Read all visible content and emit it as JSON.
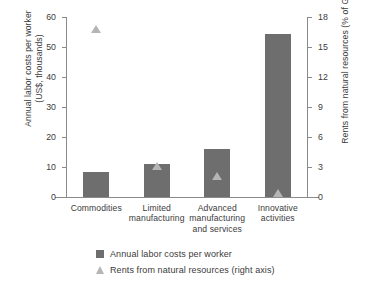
{
  "chart_data": {
    "type": "bar",
    "title": "",
    "categories": [
      "Commodities",
      "Limited\nmanufacturing",
      "Advanced\nmanufacturing\nand services",
      "Innovative\nactivities"
    ],
    "series": [
      {
        "name": "Annual labor costs per worker",
        "type": "bar",
        "axis": "left",
        "color": "#6e6e6e",
        "values": [
          8.4,
          11.1,
          16.0,
          54.3
        ]
      },
      {
        "name": "Rents from natural resources (right axis)",
        "type": "scatter",
        "axis": "right",
        "color": "#b5b5b5",
        "values": [
          16.8,
          3.1,
          2.1,
          0.4
        ]
      }
    ],
    "xlabel": "",
    "ylabel": "Annual labor costs per worker\n(US$, thousands)",
    "ylabel_right": "Rents from natural resources (% of GDP)",
    "ylim": [
      0,
      60
    ],
    "ylim_right": [
      0,
      18
    ],
    "yticks": [
      0,
      10,
      20,
      30,
      40,
      50,
      60
    ],
    "yticks_right": [
      0,
      3,
      6,
      9,
      12,
      15,
      18
    ],
    "grid": false,
    "legend_position": "bottom"
  },
  "axes": {
    "left_title": "Annual labor costs per worker\n(US$, thousands)",
    "right_title": "Rents from natural resources (% of GDP)",
    "left_ticks": [
      "60",
      "50",
      "40",
      "30",
      "20",
      "10",
      "0"
    ],
    "right_ticks": [
      "18",
      "15",
      "12",
      "9",
      "6",
      "3",
      "0"
    ]
  },
  "categories": [
    {
      "label": "Commodities"
    },
    {
      "label": "Limited\nmanufacturing"
    },
    {
      "label": "Advanced\nmanufacturing\nand services"
    },
    {
      "label": "Innovative\nactivities"
    }
  ],
  "legend": {
    "items": [
      {
        "label": "Annual labor costs per worker"
      },
      {
        "label": "Rents from natural resources (right axis)"
      }
    ]
  },
  "colors": {
    "bar": "#6e6e6e",
    "marker": "#b5b5b5",
    "axis": "#8a8a8a",
    "text": "#3b3b3b"
  }
}
